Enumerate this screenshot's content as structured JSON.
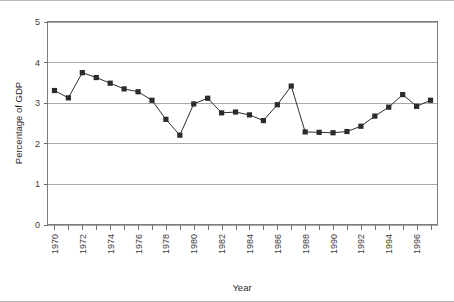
{
  "chart_data": {
    "type": "line",
    "title": "",
    "xlabel": "Year",
    "ylabel": "Percentage of GDP",
    "xlim": [
      1969.5,
      1997.5
    ],
    "ylim": [
      0,
      5
    ],
    "ytick_values": [
      0,
      1,
      2,
      3,
      4,
      5
    ],
    "ytick_labels": [
      "0",
      "1",
      "2",
      "3",
      "4",
      "5"
    ],
    "xtick_labels": [
      "1970",
      "1972",
      "1974",
      "1976",
      "1978",
      "1980",
      "1982",
      "1984",
      "1986",
      "1988",
      "1990",
      "1992",
      "1994",
      "1996"
    ],
    "xtick_label_values": [
      1970,
      1972,
      1974,
      1976,
      1978,
      1980,
      1982,
      1984,
      1986,
      1988,
      1990,
      1992,
      1994,
      1996
    ],
    "grid": "horizontal",
    "legend": "none",
    "marker": "square",
    "series_color": "#2b2b2b",
    "x": [
      1970,
      1971,
      1972,
      1973,
      1974,
      1975,
      1976,
      1977,
      1978,
      1979,
      1980,
      1981,
      1982,
      1983,
      1984,
      1985,
      1986,
      1987,
      1988,
      1989,
      1990,
      1991,
      1992,
      1993,
      1994,
      1995,
      1996,
      1997
    ],
    "values": [
      3.3,
      3.12,
      3.74,
      3.62,
      3.48,
      3.34,
      3.27,
      3.06,
      2.59,
      2.2,
      2.97,
      3.11,
      2.75,
      2.77,
      2.7,
      2.56,
      2.95,
      3.41,
      2.28,
      2.27,
      2.26,
      2.29,
      2.42,
      2.67,
      2.89,
      3.2,
      2.91,
      3.06
    ]
  }
}
